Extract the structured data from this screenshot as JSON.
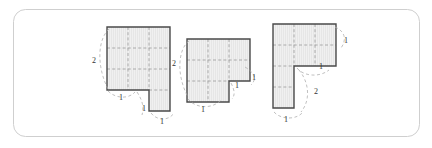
{
  "figure": {
    "frame": {
      "stroke": "#cfcfcf",
      "fill": "#ffffff",
      "corner_radius": 12,
      "x": 13,
      "y": 9,
      "width": 406,
      "height": 127
    },
    "style": {
      "outline_stroke": "#4a4a4a",
      "shape_fill": "#eeeeee",
      "hatch_stroke": "#dddddd",
      "grid_dash_stroke": "#9a9a9a",
      "brace_stroke": "#b0b0b0",
      "label_color": "#333333",
      "label_font_size": 8
    },
    "unit": 21,
    "shapes": [
      {
        "id": "shape-1",
        "name": "notched-rectangle",
        "origin": {
          "x": 107,
          "y": 27
        },
        "cells": [
          [
            0,
            0
          ],
          [
            1,
            0
          ],
          [
            2,
            0
          ],
          [
            0,
            1
          ],
          [
            1,
            1
          ],
          [
            2,
            1
          ],
          [
            0,
            2
          ],
          [
            1,
            2
          ],
          [
            2,
            2
          ],
          [
            2,
            3
          ]
        ],
        "outline_points": "0,0 3,0 3,4 2,4 2,3 0,3",
        "grid_lines": [
          "1,0 1,3",
          "2,0 2,3",
          "0,1 3,1",
          "0,2 3,2",
          "2,3 3,3"
        ],
        "labels": [
          {
            "text": "2",
            "x": -13,
            "y": 36,
            "name": "dimension-label-2-left"
          },
          {
            "text": "1",
            "x": 14,
            "y": 73,
            "name": "dimension-label-1-bottom-left"
          },
          {
            "text": "1",
            "x": 37,
            "y": 84,
            "name": "dimension-label-1-inner-vertical"
          },
          {
            "text": "1",
            "x": 55,
            "y": 97,
            "name": "dimension-label-1-bottom-right"
          }
        ],
        "braces": [
          {
            "d": "M 2,2 C -9,12 -11,38 1,62",
            "name": "brace-left-height-2"
          },
          {
            "d": "M 1,64 C 9,72 22,72 28,65",
            "name": "brace-bottom-notch-width-1"
          },
          {
            "d": "M 30,65 C 36,74 37,81 35,88",
            "name": "brace-notch-depth-1"
          },
          {
            "d": "M 44,86 C 50,94 62,94 67,86",
            "name": "brace-bottom-width-1"
          }
        ]
      },
      {
        "id": "shape-2",
        "name": "stepped-block",
        "origin": {
          "x": 187,
          "y": 39
        },
        "cells": [
          [
            0,
            0
          ],
          [
            1,
            0
          ],
          [
            2,
            0
          ],
          [
            0,
            1
          ],
          [
            1,
            1
          ],
          [
            2,
            1
          ],
          [
            0,
            2
          ],
          [
            1,
            2
          ]
        ],
        "outline_points": "0,0 3,0 3,2 2,2 2,3 0,3",
        "grid_lines": [
          "1,0 1,3",
          "2,0 2,2",
          "0,1 3,1",
          "0,2 2,2"
        ],
        "labels": [
          {
            "text": "2",
            "x": -13,
            "y": 27,
            "name": "dimension-label-2-left"
          },
          {
            "text": "1",
            "x": 50,
            "y": 49,
            "name": "dimension-label-1-step-vertical"
          },
          {
            "text": "1",
            "x": 67,
            "y": 41,
            "name": "dimension-label-1-step-right"
          },
          {
            "text": "1",
            "x": 16,
            "y": 73,
            "name": "dimension-label-1-bottom"
          }
        ],
        "braces": [
          {
            "d": "M 2,2 C -9,10 -11,36 1,58",
            "name": "brace-left-height-2"
          },
          {
            "d": "M 1,60 C 9,70 26,70 34,61",
            "name": "brace-bottom-width-1"
          },
          {
            "d": "M 44,44 C 48,52 48,56 45,60",
            "name": "brace-step-depth-1"
          },
          {
            "d": "M 58,28 C 68,34 70,40 64,46",
            "name": "brace-step-width-1"
          }
        ]
      },
      {
        "id": "shape-3",
        "name": "gamma-shape",
        "origin": {
          "x": 273,
          "y": 24
        },
        "cells": [
          [
            0,
            0
          ],
          [
            1,
            0
          ],
          [
            2,
            0
          ],
          [
            0,
            1
          ],
          [
            0,
            2
          ],
          [
            0,
            3
          ]
        ],
        "outline_points": "0,0 3,0 3,2 1,2 1,4 0,4",
        "grid_lines": [
          "1,0 1,2",
          "2,0 2,2",
          "0,1 3,1",
          "0,2 1,2",
          "0,3 1,3"
        ],
        "labels": [
          {
            "text": "1",
            "x": 73,
            "y": 19,
            "name": "dimension-label-1-right"
          },
          {
            "text": "1",
            "x": 48,
            "y": 45,
            "name": "dimension-label-1-inner-corner"
          },
          {
            "text": "2",
            "x": 43,
            "y": 70,
            "name": "dimension-label-2-lower-right"
          },
          {
            "text": "1",
            "x": 13,
            "y": 98,
            "name": "dimension-label-1-bottom"
          }
        ],
        "braces": [
          {
            "d": "M 62,3 C 72,7 74,16 68,24",
            "name": "brace-right-height-1"
          },
          {
            "d": "M 24,44 C 30,52 46,54 56,46",
            "name": "brace-corner-width-1"
          },
          {
            "d": "M 26,46 C 36,58 38,76 28,88",
            "name": "brace-lower-height-2"
          },
          {
            "d": "M 1,88 C 8,96 24,96 30,88",
            "name": "brace-bottom-width-1"
          }
        ]
      }
    ]
  }
}
